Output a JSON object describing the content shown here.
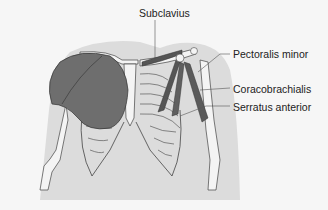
{
  "diagram": {
    "labels": [
      {
        "id": "subclavius",
        "text": "Subclavius"
      },
      {
        "id": "pectoralis-minor",
        "text": "Pectoralis minor"
      },
      {
        "id": "coracobrachialis",
        "text": "Coracobrachialis"
      },
      {
        "id": "serratus-anterior",
        "text": "Serratus anterior"
      }
    ],
    "colors": {
      "background": "#f6f6f6",
      "body_silhouette": "#dcdcdc",
      "bone": "#f4f4f4",
      "bone_outline": "#444444",
      "muscle": "#6e6e6e",
      "muscle_dark": "#555555",
      "leader_line": "#555555"
    }
  }
}
